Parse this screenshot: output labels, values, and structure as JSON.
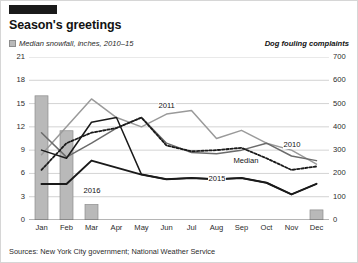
{
  "brand": {
    "tab_name": "brand-tab"
  },
  "header": {
    "title": "Season's greetings",
    "legend_left": "Median snowfall, inches, 2010–15",
    "legend_right": "Dog fouling complaints"
  },
  "footer": {
    "sources": "Sources: New York City government; National Weather Service"
  },
  "colors": {
    "bar": "#b9b9b9",
    "bar_stroke": "#8d8d8d",
    "line_2010": "#9a9a9a",
    "line_2011": "#6b6b6b",
    "line_2015": "#1a1a1a",
    "line_2016": "#1a1a1a",
    "line_median": "#1a1a1a",
    "grid": "#c8c8c8",
    "axis": "#6b6b6b",
    "text": "#121212"
  },
  "chart_data": {
    "type": "line",
    "title": "Season's greetings",
    "subtitle": "",
    "xlabel": "",
    "ylabel": "Median snowfall, inches, 2010–15",
    "y2label": "Dog fouling complaints",
    "grid": true,
    "legend_position": "inline-annotations",
    "categories": [
      "Jan",
      "Feb",
      "Mar",
      "Apr",
      "May",
      "Jun",
      "Jul",
      "Aug",
      "Sep",
      "Oct",
      "Nov",
      "Dec"
    ],
    "y_left_ticks": [
      0,
      3,
      6,
      9,
      12,
      15,
      18,
      21
    ],
    "y_right_ticks": [
      0,
      100,
      200,
      300,
      400,
      500,
      600,
      700
    ],
    "ylim": [
      0,
      21
    ],
    "y2lim": [
      0,
      700
    ],
    "bars": {
      "name": "Median snowfall, inches, 2010–15",
      "axis": "left",
      "values": [
        16.0,
        11.5,
        2.0,
        0,
        0,
        0,
        0,
        0,
        0,
        0,
        0,
        1.3
      ]
    },
    "series": [
      {
        "name": "2010",
        "axis": "right",
        "values": [
          280,
          400,
          520,
          440,
          400,
          455,
          470,
          350,
          385,
          330,
          300,
          240
        ]
      },
      {
        "name": "2011",
        "axis": "right",
        "values": [
          375,
          270,
          330,
          395,
          440,
          330,
          290,
          285,
          300,
          330,
          275,
          255
        ]
      },
      {
        "name": "Median",
        "axis": "right",
        "values": [
          215,
          330,
          375,
          395,
          440,
          320,
          295,
          300,
          310,
          265,
          215,
          230
        ]
      },
      {
        "name": "2015",
        "axis": "right",
        "values": [
          300,
          265,
          420,
          440,
          195,
          175,
          180,
          175,
          180,
          160,
          110,
          155
        ]
      },
      {
        "name": "2016",
        "axis": "right",
        "values": [
          155,
          155,
          255,
          225,
          195,
          175,
          180,
          175,
          180,
          160,
          110,
          155
        ]
      }
    ],
    "annotations": [
      {
        "text": "2011",
        "x_month": "Jun",
        "value": 490
      },
      {
        "text": "Median",
        "x_month": "Sep",
        "value": 255
      },
      {
        "text": "2015",
        "x_month": "Aug",
        "value": 175
      },
      {
        "text": "2016",
        "x_month": "Mar",
        "value": 125
      },
      {
        "text": "2010",
        "x_month": "Nov",
        "value": 320
      }
    ]
  }
}
